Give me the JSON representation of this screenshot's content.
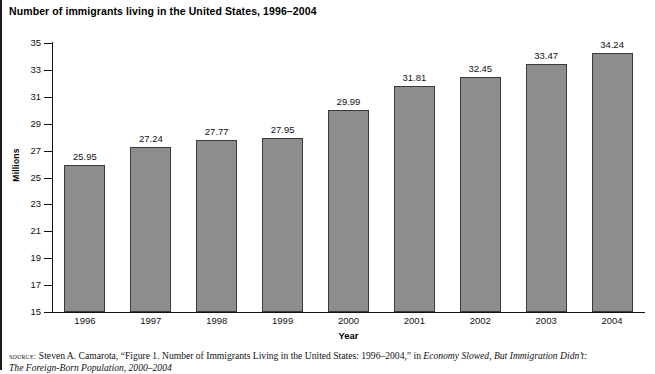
{
  "figure": {
    "title": "Number of immigrants living in the United States, 1996–2004"
  },
  "chart_data": {
    "type": "bar",
    "title": "Number of immigrants living in the United States, 1996–2004",
    "xlabel": "Year",
    "ylabel": "Millions",
    "categories": [
      "1996",
      "1997",
      "1998",
      "1999",
      "2000",
      "2001",
      "2002",
      "2003",
      "2004"
    ],
    "values": [
      25.95,
      27.24,
      27.77,
      27.95,
      29.99,
      31.81,
      32.45,
      33.47,
      34.24
    ],
    "value_labels": [
      "25.95",
      "27.24",
      "27.77",
      "27.95",
      "29.99",
      "31.81",
      "32.45",
      "33.47",
      "34.24"
    ],
    "ylim": [
      15,
      35
    ],
    "ytick_values": [
      35,
      33,
      31,
      29,
      27,
      25,
      23,
      21,
      19,
      17,
      15
    ],
    "ytick_labels": [
      "35",
      "33",
      "31",
      "29",
      "27",
      "25",
      "23",
      "21",
      "19",
      "17",
      "15"
    ],
    "ytick_step": 2,
    "grid": false,
    "legend": false,
    "legend_position": "none",
    "bar_color": "#8d8d8d",
    "bar_edge_color": "#3a3a3a",
    "axis_color": "#111111"
  },
  "source": {
    "label": "source:",
    "text_before_italic": " Steven A. Camarota, “Figure 1. Number of Immigrants Living in the United States: 1996–2004,” in ",
    "italic_title": "Economy Slowed, But Immigration Didn’t:",
    "second_line": "The Foreign-Born Population, 2000–2004"
  }
}
